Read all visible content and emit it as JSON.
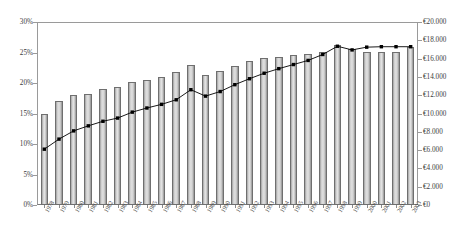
{
  "chart_data": {
    "type": "bar",
    "title": "",
    "subtitle": "",
    "xlabel": "",
    "ylabel": "",
    "categories": [
      "1978",
      "1979",
      "1980",
      "1981",
      "1982",
      "1983",
      "1984",
      "1985",
      "1986",
      "1987",
      "1988",
      "1989",
      "1990",
      "1991",
      "1992",
      "1993",
      "1994",
      "1995",
      "1996",
      "1997",
      "1998",
      "1999",
      "2000",
      "2001",
      "2002",
      "2003"
    ],
    "grid": false,
    "legend": null,
    "axes": {
      "left": {
        "label": "",
        "ylim": [
          0,
          30
        ],
        "tick_labels": [
          "0%",
          "5%",
          "10%",
          "15%",
          "20%",
          "25%",
          "30%"
        ],
        "tick_values": [
          0,
          5,
          10,
          15,
          20,
          25,
          30
        ],
        "unit": "%"
      },
      "right": {
        "label": "",
        "ylim": [
          0,
          20000
        ],
        "tick_labels": [
          "€0",
          "€2.000",
          "€4.000",
          "€6.000",
          "€8.000",
          "€10.000",
          "€12.000",
          "€14.000",
          "€16.000",
          "€18.000",
          "€20.000"
        ],
        "tick_values": [
          0,
          2000,
          4000,
          6000,
          8000,
          10000,
          12000,
          14000,
          16000,
          18000,
          20000
        ],
        "unit": "€"
      }
    },
    "series": [
      {
        "name": "bars",
        "type": "bar",
        "axis": "left",
        "color": "#cccccc",
        "edge_color": "#6f6f6f",
        "values": [
          15.0,
          17.0,
          18.0,
          18.2,
          19.0,
          19.4,
          20.2,
          20.5,
          21.0,
          21.8,
          23.0,
          21.3,
          21.9,
          22.8,
          23.6,
          24.1,
          24.3,
          24.6,
          24.8,
          25.1,
          26.3,
          25.5,
          25.1,
          25.1,
          25.1,
          25.9
        ]
      },
      {
        "name": "line",
        "type": "line",
        "axis": "right",
        "color": "#000000",
        "marker": "square",
        "values": [
          6100,
          7200,
          8100,
          8650,
          9150,
          9500,
          10150,
          10600,
          11000,
          11500,
          12600,
          11900,
          12400,
          13150,
          13800,
          14400,
          14900,
          15350,
          15800,
          16450,
          17350,
          16950,
          17250,
          17300,
          17300,
          17300
        ]
      }
    ]
  }
}
